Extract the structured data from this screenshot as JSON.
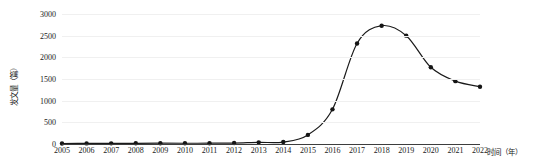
{
  "chart_data": {
    "type": "line",
    "title": "",
    "xlabel": "时间（年）",
    "ylabel": "发文量（篇）",
    "categories": [
      "2005",
      "2006",
      "2007",
      "2008",
      "2009",
      "2010",
      "2011",
      "2012",
      "2013",
      "2014",
      "2015",
      "2016",
      "2017",
      "2018",
      "2019",
      "2020",
      "2021",
      "2022"
    ],
    "values": [
      12,
      14,
      15,
      16,
      18,
      17,
      19,
      22,
      38,
      45,
      210,
      800,
      2320,
      2730,
      2500,
      1770,
      1450,
      1320
    ],
    "series": [
      {
        "name": "发文量",
        "values": [
          12,
          14,
          15,
          16,
          18,
          17,
          19,
          22,
          38,
          45,
          210,
          800,
          2320,
          2730,
          2500,
          1770,
          1450,
          1320
        ]
      }
    ],
    "ylim": [
      0,
      3000
    ],
    "ytick_values": [
      0,
      500,
      1000,
      1500,
      2000,
      2500,
      3000
    ],
    "ytick_labels": [
      "0",
      "500",
      "1000",
      "1500",
      "2000",
      "2500",
      "3000"
    ],
    "xlim_categories": [
      "2005",
      "2022"
    ],
    "grid": "horizontal",
    "legend": "none",
    "marker": "filled-circle",
    "line_color": "#1a1a1a",
    "marker_color": "#151515",
    "grid_color": "#f0f0f0",
    "axis_color": "#3d3d3d",
    "background": "#ffffff"
  }
}
